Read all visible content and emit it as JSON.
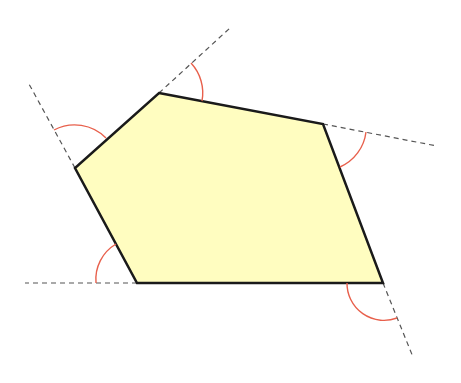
{
  "diagram": {
    "title": "",
    "width": 461,
    "height": 383,
    "colors": {
      "background": "#ffffff",
      "fill": "#FFFDC0",
      "edge": "#1a1a1a",
      "extension": "#555555",
      "arc": "#E8604C"
    },
    "polygon": {
      "vertices": [
        {
          "name": "top",
          "x": 159,
          "y": 93
        },
        {
          "name": "right",
          "x": 323,
          "y": 124
        },
        {
          "name": "bottom-right",
          "x": 383,
          "y": 283
        },
        {
          "name": "bottom-left",
          "x": 137,
          "y": 283
        },
        {
          "name": "left",
          "x": 75,
          "y": 168
        }
      ]
    },
    "extensions": [
      {
        "from": "top",
        "x1": 159,
        "y1": 93,
        "x2": 230,
        "y2": 28
      },
      {
        "from": "right",
        "x1": 323,
        "y1": 124,
        "x2": 437,
        "y2": 146
      },
      {
        "from": "bottom-right",
        "x1": 383,
        "y1": 283,
        "x2": 413,
        "y2": 357
      },
      {
        "from": "bottom-left",
        "x1": 137,
        "y1": 283,
        "x2": 25,
        "y2": 283
      },
      {
        "from": "left",
        "x1": 75,
        "y1": 168,
        "x2": 29,
        "y2": 84
      }
    ],
    "arcs": [
      {
        "at": "top",
        "d": "M 191 63 A 44 44 0 0 1 202 101"
      },
      {
        "at": "right",
        "d": "M 366 132 A 44 44 0 0 1 340 167"
      },
      {
        "at": "bottom-right",
        "d": "M 347 283 A 37 37 0 0 0 397 318"
      },
      {
        "at": "bottom-left",
        "d": "M 96 283 A 41 41 0 0 1 116 244"
      },
      {
        "at": "left",
        "d": "M 54 130 A 44 44 0 0 1 106 138"
      }
    ]
  }
}
